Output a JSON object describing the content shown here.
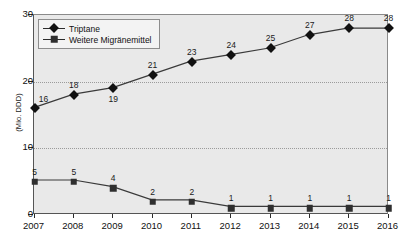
{
  "chart_data": {
    "type": "line",
    "title": "",
    "xlabel": "",
    "ylabel": "(Mio. DDD)",
    "categories": [
      "2007",
      "2008",
      "2009",
      "2010",
      "2011",
      "2012",
      "2013",
      "2014",
      "2015",
      "2016"
    ],
    "series": [
      {
        "name": "Triptane",
        "marker": "diamond",
        "color": "#111111",
        "values": [
          16,
          18,
          19,
          21,
          23,
          24,
          25,
          27,
          28,
          28
        ],
        "label_positions": [
          "right-above",
          "above",
          "below",
          "above",
          "above",
          "above",
          "above",
          "above",
          "above",
          "above"
        ]
      },
      {
        "name": "Weitere Migränemittel",
        "marker": "square",
        "color": "#2f2f2f",
        "values": [
          5,
          5,
          4,
          2,
          2,
          1,
          1,
          1,
          1,
          1
        ],
        "label_positions": [
          "above",
          "above",
          "above",
          "above",
          "above",
          "above",
          "above",
          "above",
          "above",
          "above"
        ]
      }
    ],
    "ylim": [
      0,
      30
    ],
    "yticks": [
      0,
      10,
      20,
      30
    ],
    "ytick_labels": [
      "0",
      "10",
      "20",
      "30"
    ],
    "grid": true,
    "grid_style": "dotted",
    "legend_position": "top-left",
    "plot_background": "#e9e9e9",
    "page_background": "#ffffff"
  },
  "legend": {
    "entries": [
      {
        "label": "Triptane"
      },
      {
        "label": "Weitere Migränemittel"
      }
    ]
  }
}
